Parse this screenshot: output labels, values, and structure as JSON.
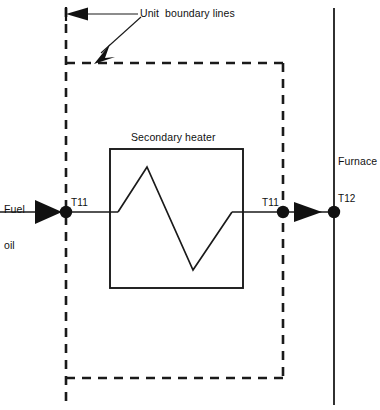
{
  "diagram": {
    "title_label": "Unit  boundary lines",
    "equipment": {
      "secondary_heater_label": "Secondary heater"
    },
    "streams": {
      "fuel_oil_line1": "Fuel",
      "fuel_oil_line2": "oil",
      "furnace_label": "Furnace"
    },
    "instruments": [
      {
        "tag": "T11",
        "position": "inlet"
      },
      {
        "tag": "T11",
        "position": "outlet"
      },
      {
        "tag": "T12",
        "position": "furnace"
      }
    ],
    "tags": {
      "t11_inlet": "T11",
      "t11_outlet": "T11",
      "t12_furnace": "T12"
    },
    "colors": {
      "line": "#1a1a1a",
      "background": "#ffffff",
      "node_fill": "#111111"
    },
    "geometry": {
      "boundary_left_x": 66,
      "boundary_right_x": 283,
      "boundary_top_y": 63,
      "boundary_bottom_y": 378,
      "pipe_y": 212,
      "furnace_x": 334,
      "heater_box": {
        "x": 110,
        "y": 149,
        "width": 133,
        "height": 139
      }
    }
  }
}
